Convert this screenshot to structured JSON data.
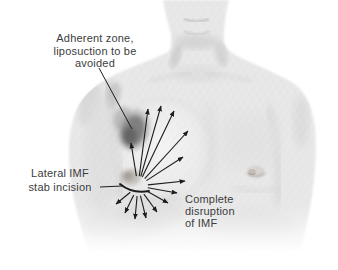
{
  "labels": {
    "adherent_zone": {
      "line1": "Adherent zone,",
      "line2": "liposuction to be",
      "line3": "avoided"
    },
    "lateral_imf": {
      "line1": "Lateral IMF",
      "line2": "stab incision"
    },
    "disruption": {
      "line1": "Complete",
      "line2": "disruption",
      "line3": "of IMF"
    }
  },
  "colors": {
    "background": "#ffffff",
    "body_tone": "#e8e8e8",
    "shadow_tone": "#c9c9c9",
    "annotation_ink": "#1c1c1c",
    "label_text": "#3c3c3c",
    "adherent_patch": "#6f6f6f",
    "incision_smudge": "#9b948a"
  },
  "diagram": {
    "arrow_origin": {
      "x": 138,
      "y": 186
    },
    "arrow_gap": 10,
    "arrow_tips": [
      [
        131,
        143
      ],
      [
        148,
        109
      ],
      [
        161,
        106
      ],
      [
        174,
        111
      ],
      [
        188,
        131
      ],
      [
        183,
        157
      ],
      [
        185,
        181
      ],
      [
        177,
        193
      ],
      [
        168,
        203
      ],
      [
        157,
        212
      ],
      [
        146,
        218
      ],
      [
        135,
        219
      ],
      [
        125,
        213
      ],
      [
        116,
        204
      ]
    ],
    "leader_adherent": {
      "x1": 99,
      "y1": 68,
      "x2": 132,
      "y2": 129
    },
    "leader_incision": {
      "x1": 100,
      "y1": 187,
      "x2": 122,
      "y2": 186
    }
  }
}
